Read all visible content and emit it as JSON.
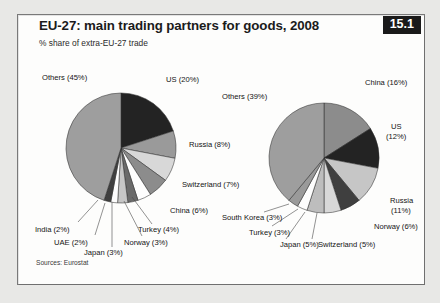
{
  "figure": {
    "title": "EU-27: main trading partners for goods, 2008",
    "subtitle": "% share of extra-EU-27 trade",
    "badge": "15.1",
    "source": "Sources: Eurostat",
    "badge_bg": "#1a1a1a",
    "badge_fg": "#ffffff",
    "panel_bg": "#fdfdfc",
    "page_bg": "#e8e8e6",
    "border_color": "#6f6f6f"
  },
  "chart_data": [
    {
      "type": "pie",
      "title": "EU-27 exports of goods: main partners, 2008",
      "subtitle": "% share of extra-EU-27 trade",
      "categories": [
        "US",
        "Russia",
        "Switzerland",
        "China",
        "Turkey",
        "Norway",
        "Japan",
        "UAE",
        "India",
        "Others"
      ],
      "values": [
        20,
        8,
        7,
        6,
        4,
        3,
        3,
        2,
        2,
        45
      ],
      "labels": [
        "US (20%)",
        "Russia (8%)",
        "Switzerland (7%)",
        "China (6%)",
        "Turkey (4%)",
        "Norway (3%)",
        "Japan (3%)",
        "UAE (2%)",
        "India (2%)",
        "Others (45%)"
      ],
      "colors": [
        "#232323",
        "#9a9a9a",
        "#d8d8d8",
        "#8c8c8c",
        "#fdfdfd",
        "#6a6a6a",
        "#c6c6c6",
        "#fdfdfd",
        "#3f3f3f",
        "#9e9e9e"
      ],
      "start_angle_deg": 0,
      "direction": "clockwise",
      "legend": "none",
      "grid": false,
      "center": [
        121,
        148
      ],
      "radius": 55
    },
    {
      "type": "pie",
      "title": "EU-27 imports of goods: main partners, 2008",
      "subtitle": "% share of extra-EU-27 trade",
      "categories": [
        "China",
        "US",
        "Russia",
        "Norway",
        "Switzerland",
        "Japan",
        "Turkey",
        "South Korea",
        "Others"
      ],
      "values": [
        16,
        12,
        11,
        6,
        5,
        5,
        3,
        3,
        39
      ],
      "labels": [
        "China (16%)",
        "US (12%)",
        "Russia (11%)",
        "Norway (6%)",
        "Switzerland (5%)",
        "Japan (5%)",
        "Turkey (3%)",
        "South Korea (3%)",
        "Others (39%)"
      ],
      "colors": [
        "#8c8c8c",
        "#232323",
        "#c6c6c6",
        "#3f3f3f",
        "#d8d8d8",
        "#bdbdbd",
        "#fdfdfd",
        "#9a9a9a",
        "#9e9e9e"
      ],
      "start_angle_deg": 0,
      "direction": "clockwise",
      "legend": "none",
      "grid": false,
      "center": [
        324,
        158
      ],
      "radius": 55
    }
  ],
  "labels_left": {
    "others": "Others (45%)",
    "us": "US (20%)",
    "russia": "Russia (8%)",
    "switzerland": "Switzerland (7%)",
    "china": "China (6%)",
    "turkey": "Turkey (4%)",
    "norway": "Norway (3%)",
    "japan": "Japan (3%)",
    "uae": "UAE (2%)",
    "india": "India (2%)"
  },
  "labels_right": {
    "china": "China (16%)",
    "us_l1": "US",
    "us_l2": "(12%)",
    "others": "Others (39%)",
    "russia_l1": "Russia",
    "russia_l2": "(11%)",
    "norway": "Norway (6%)",
    "switzerland": "Switzerland (5%)",
    "japan": "Japan (5%)",
    "turkey": "Turkey (3%)",
    "south_korea": "South Korea (3%)"
  }
}
